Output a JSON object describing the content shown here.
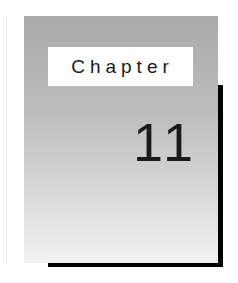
{
  "chapter": {
    "label": "Chapter",
    "number": "11"
  },
  "colors": {
    "panel_top": "#a9a9a9",
    "panel_bottom": "#f2f2f2",
    "shadow": "#000000",
    "label_bg": "#ffffff"
  }
}
